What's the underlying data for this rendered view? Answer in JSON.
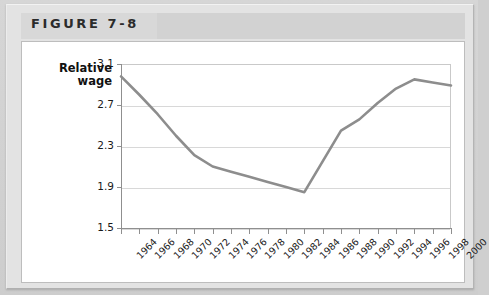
{
  "figure": {
    "title": "FIGURE 7-8"
  },
  "chart_data": {
    "type": "line",
    "title": "",
    "xlabel": "",
    "ylabel": "Relative\nwage",
    "ylabel_line1": "Relative",
    "ylabel_line2": "wage",
    "ylim": [
      1.5,
      3.1
    ],
    "yticks": [
      "3.1",
      "2.7",
      "2.3",
      "1.9",
      "1.5"
    ],
    "ytick_values": [
      3.1,
      2.7,
      2.3,
      1.9,
      1.5
    ],
    "grid": true,
    "legend": "none",
    "categories": [
      "1964",
      "1966",
      "1968",
      "1970",
      "1972",
      "1974",
      "1976",
      "1978",
      "1980",
      "1982",
      "1984",
      "1986",
      "1988",
      "1990",
      "1992",
      "1994",
      "1996",
      "1998",
      "2000"
    ],
    "x": [
      1964,
      1966,
      1968,
      1970,
      1972,
      1974,
      1976,
      1978,
      1980,
      1982,
      1984,
      1986,
      1988,
      1990,
      1992,
      1994,
      1996,
      1998,
      2000
    ],
    "values": [
      2.98,
      2.8,
      2.61,
      2.4,
      2.21,
      2.1,
      2.05,
      2.0,
      1.95,
      1.9,
      1.85,
      2.15,
      2.45,
      2.56,
      2.72,
      2.86,
      2.95,
      2.92,
      2.89
    ],
    "series": [
      {
        "name": "Relative wage",
        "color": "#8d8d8d",
        "values": [
          2.98,
          2.8,
          2.61,
          2.4,
          2.21,
          2.1,
          2.05,
          2.0,
          1.95,
          1.9,
          1.85,
          2.15,
          2.45,
          2.56,
          2.72,
          2.86,
          2.95,
          2.92,
          2.89
        ]
      }
    ]
  },
  "colors": {
    "line": "#8d8d8d",
    "grid": "#d8d8d8",
    "axis": "#8f8f8f",
    "plate": "#e3e3e3",
    "header_band": "#d2d2d2",
    "card": "#ffffff"
  }
}
